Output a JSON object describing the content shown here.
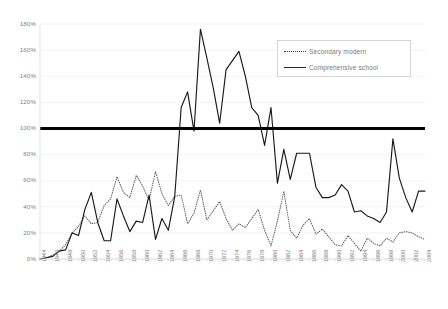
{
  "chart_data": {
    "type": "line",
    "title": "",
    "subtitle": "",
    "xlabel": "",
    "ylabel": "",
    "xlim": [
      1944,
      2004
    ],
    "ylim": [
      0,
      180
    ],
    "ytick_labels": [
      "0%",
      "20%",
      "40%",
      "60%",
      "80%",
      "100%",
      "120%",
      "140%",
      "160%",
      "180%"
    ],
    "ytick_values": [
      0,
      20,
      40,
      60,
      80,
      100,
      120,
      140,
      160,
      180
    ],
    "grid": "horizontal",
    "legend_position": "top-right",
    "reference_line": {
      "value": 100,
      "label": "100%",
      "style": "thick-solid",
      "color": "#000000"
    },
    "x": [
      1944,
      1945,
      1946,
      1947,
      1948,
      1949,
      1950,
      1951,
      1952,
      1953,
      1954,
      1955,
      1956,
      1957,
      1958,
      1959,
      1960,
      1961,
      1962,
      1963,
      1964,
      1965,
      1966,
      1967,
      1968,
      1969,
      1970,
      1971,
      1972,
      1973,
      1974,
      1975,
      1976,
      1977,
      1978,
      1979,
      1980,
      1981,
      1982,
      1983,
      1984,
      1985,
      1986,
      1987,
      1988,
      1989,
      1990,
      1991,
      1992,
      1993,
      1994,
      1995,
      1996,
      1997,
      1998,
      1999,
      2000,
      2001,
      2002,
      2003,
      2004
    ],
    "xtick_labels": [
      "1944",
      "1946",
      "1948",
      "1950",
      "1952",
      "1954",
      "1956",
      "1958",
      "1960",
      "1962",
      "1964",
      "1966",
      "1968",
      "1970",
      "1972",
      "1974",
      "1976",
      "1978",
      "1980",
      "1982",
      "1984",
      "1986",
      "1988",
      "1990",
      "1992",
      "1994",
      "1996",
      "1998",
      "2000",
      "2002",
      "2004"
    ],
    "xtick_step": 2,
    "series": [
      {
        "name": "Secondary modern",
        "style": "dotted",
        "color": "#595959",
        "values": [
          0,
          1,
          3,
          6,
          11,
          20,
          25,
          33,
          27,
          28,
          41,
          46,
          63,
          51,
          47,
          64,
          56,
          45,
          67,
          50,
          41,
          48,
          49,
          27,
          35,
          53,
          30,
          37,
          44,
          31,
          22,
          27,
          24,
          31,
          38,
          22,
          10,
          29,
          52,
          22,
          16,
          26,
          31,
          19,
          23,
          17,
          11,
          10,
          18,
          12,
          6,
          16,
          12,
          10,
          16,
          13,
          20,
          21,
          20,
          17,
          15
        ]
      },
      {
        "name": "Comprehensive school",
        "style": "solid",
        "color": "#1a1a1a",
        "values": [
          0,
          1,
          2,
          6,
          7,
          20,
          18,
          38,
          51,
          28,
          14,
          14,
          46,
          33,
          21,
          29,
          28,
          49,
          15,
          31,
          22,
          48,
          116,
          128,
          98,
          176,
          154,
          131,
          104,
          145,
          152,
          159,
          140,
          116,
          110,
          87,
          116,
          58,
          84,
          61,
          81,
          81,
          81,
          55,
          47,
          47,
          49,
          57,
          52,
          36,
          37,
          33,
          31,
          28,
          36,
          92,
          62,
          47,
          36,
          52,
          52
        ]
      }
    ]
  },
  "legend": {
    "items": [
      {
        "label": "Secondary modern",
        "style": "dotted"
      },
      {
        "label": "Comprehensive school",
        "style": "solid"
      }
    ]
  }
}
